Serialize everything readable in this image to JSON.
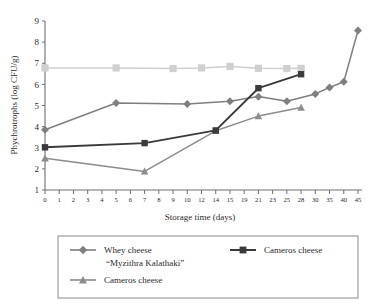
{
  "chart_data": {
    "type": "line",
    "title": "",
    "xlabel": "Storage time (days)",
    "ylabel": "Phychrotrophs (log CFU/g)",
    "ylim": [
      1,
      9
    ],
    "yticks": [
      1,
      2,
      3,
      4,
      5,
      6,
      7,
      8,
      9
    ],
    "grid": false,
    "legend_position": "bottom",
    "categories": [
      "0",
      "1",
      "2",
      "3",
      "4",
      "5",
      "6",
      "7",
      "8",
      "9",
      "10",
      "12",
      "14",
      "15",
      "19",
      "21",
      "23",
      "25",
      "28",
      "30",
      "35",
      "40",
      "45"
    ],
    "xtick_labels": [
      "0",
      "1",
      "2",
      "3",
      "4",
      "5",
      "6",
      "7",
      "8",
      "9",
      "10",
      "12",
      "14",
      "15",
      "19",
      "21",
      "23",
      "25",
      "28",
      "30",
      "35",
      "40",
      "45"
    ],
    "series": [
      {
        "name": "Whey cheese “Myzithra Kalathaki”",
        "legend_label_line1": "Whey cheese",
        "legend_label_line2": "“Myzithra Kalathaki”",
        "color": "#7f7f7f",
        "marker": "diamond",
        "x": [
          "0",
          "5",
          "10",
          "15",
          "21",
          "25",
          "30",
          "35",
          "40",
          "45"
        ],
        "values": [
          3.85,
          5.12,
          5.07,
          5.2,
          5.42,
          5.2,
          5.55,
          5.85,
          6.12,
          8.55
        ]
      },
      {
        "name": "Cameros cheese (dark)",
        "legend_label_line1": "Cameros cheese",
        "legend_label_line2": "",
        "color": "#3a3a3a",
        "marker": "square",
        "x": [
          "0",
          "7",
          "14",
          "21",
          "28"
        ],
        "values": [
          3.02,
          3.22,
          3.82,
          5.82,
          6.48
        ]
      },
      {
        "name": "Cameros cheese (gray)",
        "legend_label_line1": "Cameros cheese",
        "legend_label_line2": "",
        "color": "#8c8c8c",
        "marker": "triangle",
        "x": [
          "0",
          "7",
          "14",
          "21",
          "28"
        ],
        "values": [
          2.5,
          1.88,
          3.8,
          4.5,
          4.9
        ]
      },
      {
        "name": "Flat reference series",
        "legend_label_line1": "",
        "legend_label_line2": "",
        "color": "#cfcfcf",
        "marker": "square",
        "x": [
          "0",
          "5",
          "9",
          "12",
          "15",
          "21",
          "25",
          "28"
        ],
        "values": [
          6.78,
          6.78,
          6.75,
          6.78,
          6.85,
          6.76,
          6.75,
          6.76
        ]
      }
    ]
  },
  "legend": {
    "entries": [
      {
        "label_line1": "Whey cheese",
        "label_line2": "“Myzithra Kalathaki”",
        "color": "#7f7f7f",
        "marker": "diamond"
      },
      {
        "label_line1": "Cameros cheese",
        "label_line2": "",
        "color": "#3a3a3a",
        "marker": "square"
      },
      {
        "label_line1": "Cameros cheese",
        "label_line2": "",
        "color": "#8c8c8c",
        "marker": "triangle"
      }
    ]
  },
  "colors": {
    "axis": "#6f6f6f",
    "text": "#2b2b2b",
    "background": "#ffffff",
    "legend_border": "#8a8a8a"
  }
}
